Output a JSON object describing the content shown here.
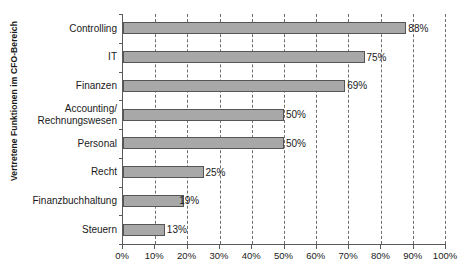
{
  "chart_data": {
    "type": "bar",
    "orientation": "horizontal",
    "title": "",
    "xlabel": "",
    "ylabel": "Vertretene Funktionen im CFO-Bereich",
    "categories": [
      "Controlling",
      "IT",
      "Finanzen",
      "Accounting/\nRechnungswesen",
      "Personal",
      "Recht",
      "Finanzbuchhaltung",
      "Steuern"
    ],
    "values": [
      88,
      75,
      69,
      50,
      50,
      25,
      19,
      13
    ],
    "data_labels": [
      "88%",
      "75%",
      "69%",
      "50%",
      "50%",
      "25%",
      "19%",
      "13%"
    ],
    "xlim": [
      0,
      100
    ],
    "xticks": [
      0,
      10,
      20,
      30,
      40,
      50,
      60,
      70,
      80,
      90,
      100
    ],
    "xtick_labels": [
      "0%",
      "10%",
      "20%",
      "30%",
      "40%",
      "50%",
      "60%",
      "70%",
      "80%",
      "90%",
      "100%"
    ],
    "grid": true,
    "grid_axis": "x",
    "grid_style": "dashed",
    "legend": false,
    "bar_color": "#a8a8a8",
    "bar_border_color": "#555555",
    "axis_color": "#5a5a5a"
  }
}
